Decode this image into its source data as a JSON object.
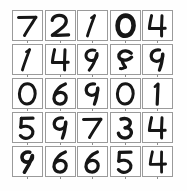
{
  "figure": {
    "title": "",
    "type": "image-grid",
    "rows": 5,
    "columns": 5,
    "background_color": "#fefefe",
    "cell_border_color": "#9a9a9a",
    "cell_background_color": "#ffffff",
    "ink_color": "#161616"
  },
  "chart_data": {
    "type": "table",
    "title": "",
    "xlabel": "",
    "ylabel": "",
    "rows": 5,
    "columns": 5,
    "categories": [
      "col-1",
      "col-2",
      "col-3",
      "col-4",
      "col-5"
    ],
    "values": [
      [
        7,
        2,
        1,
        0,
        4
      ],
      [
        1,
        4,
        9,
        5,
        9
      ],
      [
        0,
        6,
        9,
        0,
        1
      ],
      [
        5,
        9,
        7,
        3,
        4
      ],
      [
        9,
        6,
        6,
        5,
        4
      ]
    ]
  },
  "cells": [
    {
      "row": 0,
      "col": 0,
      "label": "7",
      "style": "straight-bar-7"
    },
    {
      "row": 0,
      "col": 1,
      "label": "2",
      "style": "curly-2"
    },
    {
      "row": 0,
      "col": 2,
      "label": "1",
      "style": "slanted-1"
    },
    {
      "row": 0,
      "col": 3,
      "label": "0",
      "style": "bold-round-0"
    },
    {
      "row": 0,
      "col": 4,
      "label": "4",
      "style": "open-4"
    },
    {
      "row": 1,
      "col": 0,
      "label": "1",
      "style": "slanted-1"
    },
    {
      "row": 1,
      "col": 1,
      "label": "4",
      "style": "open-4"
    },
    {
      "row": 1,
      "col": 2,
      "label": "9",
      "style": "small-loop-9"
    },
    {
      "row": 1,
      "col": 3,
      "label": "5",
      "style": "loopy-5"
    },
    {
      "row": 1,
      "col": 4,
      "label": "9",
      "style": "round-9"
    },
    {
      "row": 2,
      "col": 0,
      "label": "0",
      "style": "oval-0"
    },
    {
      "row": 2,
      "col": 1,
      "label": "6",
      "style": "curved-6"
    },
    {
      "row": 2,
      "col": 2,
      "label": "9",
      "style": "round-9"
    },
    {
      "row": 2,
      "col": 3,
      "label": "0",
      "style": "oval-0"
    },
    {
      "row": 2,
      "col": 4,
      "label": "1",
      "style": "hooked-1"
    },
    {
      "row": 3,
      "col": 0,
      "label": "5",
      "style": "flat-top-5"
    },
    {
      "row": 3,
      "col": 1,
      "label": "9",
      "style": "round-9"
    },
    {
      "row": 3,
      "col": 2,
      "label": "7",
      "style": "straight-bar-7"
    },
    {
      "row": 3,
      "col": 3,
      "label": "3",
      "style": "curly-3"
    },
    {
      "row": 3,
      "col": 4,
      "label": "4",
      "style": "open-4"
    },
    {
      "row": 4,
      "col": 0,
      "label": "9",
      "style": "angular-9"
    },
    {
      "row": 4,
      "col": 1,
      "label": "6",
      "style": "curved-6"
    },
    {
      "row": 4,
      "col": 2,
      "label": "6",
      "style": "curved-6"
    },
    {
      "row": 4,
      "col": 3,
      "label": "5",
      "style": "flat-top-5"
    },
    {
      "row": 4,
      "col": 4,
      "label": "4",
      "style": "closed-4"
    }
  ]
}
